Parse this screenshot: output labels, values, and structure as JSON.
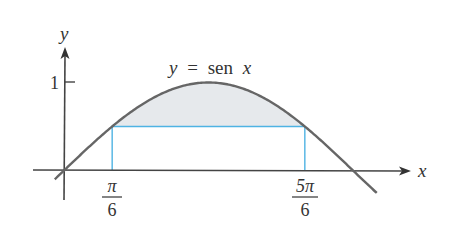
{
  "figure": {
    "curve_label": {
      "lhs": "y",
      "eq": "=",
      "fn": "sen",
      "var": "x"
    },
    "axes": {
      "x_label": "x",
      "y_label": "y"
    },
    "y_tick": {
      "label": "1",
      "value": 1
    },
    "x_ticks": [
      {
        "num": "π",
        "den": "6",
        "value": 0.5236
      },
      {
        "num": "5π",
        "den": "6",
        "value": 2.618
      }
    ],
    "colors": {
      "curve": "#666666",
      "axis": "#444444",
      "rect": "#4fb3e3",
      "shade": "#e6e9ec",
      "text": "#333333"
    }
  },
  "chart_data": {
    "type": "line",
    "title": "y = sen x",
    "xlabel": "x",
    "ylabel": "y",
    "function": "sin(x)",
    "x_range": [
      -0.1,
      3.4
    ],
    "x": [
      0,
      0.5236,
      1.0472,
      1.5708,
      2.0944,
      2.618,
      3.1416
    ],
    "values": [
      0,
      0.5,
      0.866,
      1,
      0.866,
      0.5,
      0
    ],
    "rectangle": {
      "x_from": 0.5236,
      "x_to": 2.618,
      "height": 0.5
    },
    "shaded_region": "between y = sen x and y = 0.5 for x in [π/6, 5π/6]",
    "y_ticks": [
      1
    ],
    "x_ticks": [
      "π/6",
      "5π/6"
    ],
    "grid": false
  }
}
